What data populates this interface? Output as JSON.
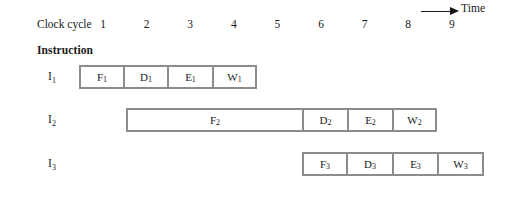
{
  "header": {
    "clock_cycle_label": "Clock cycle",
    "time_label": "Time",
    "time_arrow_icon": "right-arrow-icon",
    "cycles": [
      "1",
      "2",
      "3",
      "4",
      "5",
      "6",
      "7",
      "8",
      "9"
    ]
  },
  "instruction_label": "Instruction",
  "rows": [
    {
      "label": "I",
      "label_sub": "1",
      "start_px": 79,
      "top_px": 65,
      "stages": [
        {
          "name": "F",
          "sub": "1",
          "width_px": 45
        },
        {
          "name": "D",
          "sub": "1",
          "width_px": 44
        },
        {
          "name": "E",
          "sub": "1",
          "width_px": 45
        },
        {
          "name": "W",
          "sub": "1",
          "width_px": 44
        }
      ]
    },
    {
      "label": "I",
      "label_sub": "2",
      "start_px": 126,
      "top_px": 108,
      "stages": [
        {
          "name": "F",
          "sub": "2",
          "width_px": 177
        },
        {
          "name": "D",
          "sub": "2",
          "width_px": 45
        },
        {
          "name": "E",
          "sub": "2",
          "width_px": 45
        },
        {
          "name": "W",
          "sub": "2",
          "width_px": 44
        }
      ]
    },
    {
      "label": "I",
      "label_sub": "3",
      "start_px": 302,
      "top_px": 152,
      "stages": [
        {
          "name": "F",
          "sub": "3",
          "width_px": 45
        },
        {
          "name": "D",
          "sub": "3",
          "width_px": 46
        },
        {
          "name": "E",
          "sub": "3",
          "width_px": 45
        },
        {
          "name": "W",
          "sub": "3",
          "width_px": 46
        }
      ]
    }
  ],
  "geometry": {
    "cycle_first_center_px": 103,
    "cycle_spacing_px": 43.6,
    "row_label_left_px": 35
  },
  "colors": {
    "box_border": "#8c8c8c",
    "text": "#1a1a1a",
    "background": "#ffffff"
  }
}
